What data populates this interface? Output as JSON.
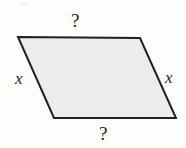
{
  "figure": {
    "kind": "geometry-diagram",
    "shape": "parallelogram",
    "title": "",
    "background_color": "#fdfdfc",
    "fill_color": "#ececec",
    "stroke_color": "#231f20",
    "stroke_width": 2,
    "vertices": {
      "top_left": [
        18,
        37
      ],
      "top_right": [
        140,
        38
      ],
      "bottom_right": [
        176,
        118
      ],
      "bottom_left": [
        54,
        118
      ]
    },
    "labels": {
      "top": "?",
      "bottom": "?",
      "left": "x",
      "right": "x"
    },
    "label_positions": {
      "top": [
        78,
        20
      ],
      "bottom": [
        105,
        133
      ],
      "left": [
        20,
        79
      ],
      "right": [
        170,
        78
      ]
    }
  }
}
